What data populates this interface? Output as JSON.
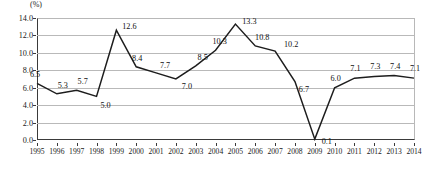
{
  "chart_data": {
    "type": "line",
    "title": "",
    "subtitle": "",
    "xlabel": "",
    "ylabel": "",
    "unit_label": "(%)",
    "grid": true,
    "legend": "none",
    "ylim": [
      0.0,
      14.0
    ],
    "ytick_step": 2.0,
    "ytick_labels": [
      "0.0",
      "2.0",
      "4.0",
      "6.0",
      "8.0",
      "10.0",
      "12.0",
      "14.0"
    ],
    "ytick_values": [
      0.0,
      2.0,
      4.0,
      6.0,
      8.0,
      10.0,
      12.0,
      14.0
    ],
    "categories": [
      "1995",
      "1996",
      "1997",
      "1998",
      "1999",
      "2000",
      "2001",
      "2002",
      "2003",
      "2004",
      "2005",
      "2006",
      "2007",
      "2008",
      "2009",
      "2010",
      "2011",
      "2012",
      "2013",
      "2014"
    ],
    "values": [
      6.5,
      5.3,
      5.7,
      5.0,
      12.6,
      8.4,
      7.7,
      7.0,
      8.5,
      10.3,
      13.3,
      10.8,
      10.2,
      6.7,
      0.1,
      6.0,
      7.1,
      7.3,
      7.4,
      7.1
    ],
    "data_labels": [
      "6.5",
      "5.3",
      "5.7",
      "5.0",
      "12.6",
      "8.4",
      "7.7",
      "7.0",
      "8.5",
      "10.3",
      "13.3",
      "10.8",
      "10.2",
      "6.7",
      "0.1",
      "6.0",
      "7.1",
      "7.3",
      "7.4",
      "7.1"
    ],
    "series": [
      {
        "name": "",
        "color": "#1d1d1d",
        "values": [
          6.5,
          5.3,
          5.7,
          5.0,
          12.6,
          8.4,
          7.7,
          7.0,
          8.5,
          10.3,
          13.3,
          10.8,
          10.2,
          6.7,
          0.1,
          6.0,
          7.1,
          7.3,
          7.4,
          7.1
        ]
      }
    ],
    "colors": {
      "line": "#1d1d1d",
      "grid": "#b9b9b9",
      "axis": "#3a3a3a",
      "text": "#111111",
      "background": "#ffffff"
    },
    "label_offsets": [
      {
        "dx": -2,
        "dy": -9
      },
      {
        "dx": 6,
        "dy": -9
      },
      {
        "dx": 6,
        "dy": -9
      },
      {
        "dx": 9,
        "dy": 9
      },
      {
        "dx": 13,
        "dy": -4
      },
      {
        "dx": 1,
        "dy": -9
      },
      {
        "dx": 9,
        "dy": -8
      },
      {
        "dx": 11,
        "dy": 7
      },
      {
        "dx": 7,
        "dy": -9
      },
      {
        "dx": 4,
        "dy": -9
      },
      {
        "dx": 14,
        "dy": -3
      },
      {
        "dx": 7,
        "dy": -9
      },
      {
        "dx": 16,
        "dy": -7
      },
      {
        "dx": 9,
        "dy": 7
      },
      {
        "dx": 12,
        "dy": 2
      },
      {
        "dx": 1,
        "dy": -10
      },
      {
        "dx": 1,
        "dy": -10
      },
      {
        "dx": 1,
        "dy": -10
      },
      {
        "dx": 1,
        "dy": -10
      },
      {
        "dx": 1,
        "dy": -10
      }
    ]
  }
}
